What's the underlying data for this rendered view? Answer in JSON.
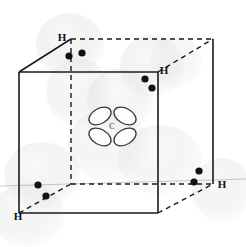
{
  "figure": {
    "background_color": "#ffffff",
    "line_color": "#1a1a1a",
    "electron_color": "#111111",
    "cloud_color": "#dcdcdc",
    "orbital_stroke": "#333333"
  },
  "cube": {
    "description": "Reference cube with tetrahedral vertices",
    "solid_edge_style": "solid",
    "hidden_edge_style": "dashed",
    "vertices": {
      "front_top_left": {
        "x": 19,
        "y": 72
      },
      "front_top_right": {
        "x": 158,
        "y": 72
      },
      "front_bottom_left": {
        "x": 19,
        "y": 213
      },
      "front_bottom_right": {
        "x": 158,
        "y": 213
      },
      "back_top_left": {
        "x": 71,
        "y": 39
      },
      "back_top_right": {
        "x": 213,
        "y": 39
      },
      "back_bottom_left": {
        "x": 71,
        "y": 184
      },
      "back_bottom_right": {
        "x": 213,
        "y": 184
      }
    }
  },
  "atoms": {
    "carbon": {
      "label": "C",
      "position": {
        "x": 112,
        "y": 126
      },
      "orbital_type": "sp3-hybrid-lobes",
      "lobe_count": 4
    },
    "hydrogens": [
      {
        "id": "h-back-top-left",
        "label": "H",
        "x": 71,
        "y": 39,
        "label_dx": -9,
        "label_dy": -2
      },
      {
        "id": "h-front-top-right",
        "label": "H",
        "x": 158,
        "y": 72,
        "label_dx": 6,
        "label_dy": -1
      },
      {
        "id": "h-front-bottom-left",
        "label": "H",
        "x": 19,
        "y": 213,
        "label_dx": -1,
        "label_dy": 5
      },
      {
        "id": "h-back-bottom-right",
        "label": "H",
        "x": 213,
        "y": 184,
        "label_dx": 9,
        "label_dy": 3
      }
    ]
  },
  "electron_pairs": [
    {
      "id": "pair-top-left",
      "dots": [
        {
          "x": 69,
          "y": 56
        },
        {
          "x": 82,
          "y": 53
        }
      ]
    },
    {
      "id": "pair-top-right",
      "dots": [
        {
          "x": 145,
          "y": 79
        },
        {
          "x": 152,
          "y": 88
        }
      ]
    },
    {
      "id": "pair-bottom-left",
      "dots": [
        {
          "x": 38,
          "y": 185
        },
        {
          "x": 46,
          "y": 196
        }
      ]
    },
    {
      "id": "pair-bottom-right",
      "dots": [
        {
          "x": 199,
          "y": 171
        },
        {
          "x": 194,
          "y": 182
        }
      ]
    }
  ],
  "electron_clouds": [
    {
      "id": "cloud-top-left",
      "cx": 70,
      "cy": 45,
      "rx": 34,
      "ry": 32,
      "opacity": 0.55
    },
    {
      "id": "cloud-top-left-lower",
      "cx": 78,
      "cy": 92,
      "rx": 32,
      "ry": 34,
      "opacity": 0.5
    },
    {
      "id": "cloud-top-right",
      "cx": 152,
      "cy": 66,
      "rx": 32,
      "ry": 31,
      "opacity": 0.55
    },
    {
      "id": "cloud-center-upper",
      "cx": 120,
      "cy": 100,
      "rx": 33,
      "ry": 31,
      "opacity": 0.5
    },
    {
      "id": "cloud-center",
      "cx": 108,
      "cy": 145,
      "rx": 40,
      "ry": 36,
      "opacity": 0.45
    },
    {
      "id": "cloud-bottom-left",
      "cx": 42,
      "cy": 175,
      "rx": 38,
      "ry": 33,
      "opacity": 0.5
    },
    {
      "id": "cloud-bottom-left-2",
      "cx": 28,
      "cy": 215,
      "rx": 36,
      "ry": 32,
      "opacity": 0.5
    },
    {
      "id": "cloud-bottom-mid",
      "cx": 160,
      "cy": 160,
      "rx": 42,
      "ry": 35,
      "opacity": 0.45
    },
    {
      "id": "cloud-bottom-right",
      "cx": 222,
      "cy": 190,
      "rx": 30,
      "ry": 32,
      "opacity": 0.5
    },
    {
      "id": "cloud-top-right-hi",
      "cx": 176,
      "cy": 62,
      "rx": 26,
      "ry": 26,
      "opacity": 0.4
    }
  ],
  "bonds": [
    {
      "id": "bond-c-h-back-top-left",
      "from": "carbon",
      "to": "h-back-top-left",
      "style": "dashed"
    },
    {
      "id": "bond-c-h-front-top-right",
      "from": "carbon",
      "to": "h-front-top-right",
      "style": "dashed"
    },
    {
      "id": "bond-c-h-front-bottom-left",
      "from": "carbon",
      "to": "h-front-bottom-left",
      "style": "dashed"
    },
    {
      "id": "bond-c-h-back-bottom-right",
      "from": "carbon",
      "to": "h-back-bottom-right",
      "style": "dashed"
    }
  ]
}
